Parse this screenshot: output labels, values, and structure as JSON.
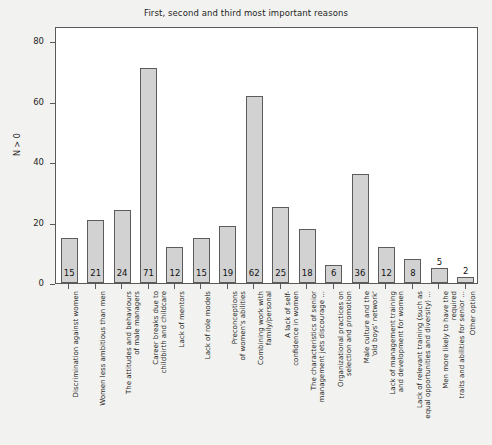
{
  "chart_data": {
    "type": "bar",
    "title": "First, second and third most important reasons",
    "xlabel": "",
    "ylabel": "N > 0",
    "ylim": [
      0,
      85
    ],
    "yticks": [
      0,
      20,
      40,
      60,
      80
    ],
    "grid": false,
    "legend": null,
    "categories": [
      "Discrimination against women",
      "Women less ambitious than men",
      "The attitudes and behaviours\nof male managers",
      "Career breaks due to\nchildbirth and childcare",
      "Lack of mentors",
      "Lack of role models",
      "Preconceptions\nof women's abilities",
      "Combining work with\nfamily/personal",
      "A lack of self-\nconfidence in women",
      "The characteristics of senior\nmanagement jets discourage ...",
      "Organizational practices on\nselection and promotion",
      "Male culture and the\n'old boys' network'",
      "Lack of management training\nand development for women",
      "Lack of relevant training (such as\nequal opportunities and diversity) ...",
      "Men more likely to have the required\ntraits and abilities for senior ...",
      "Other option"
    ],
    "values": [
      15,
      21,
      24,
      71,
      12,
      15,
      19,
      62,
      25,
      18,
      6,
      36,
      12,
      8,
      5,
      2
    ],
    "bar_color": "#d2d2d2",
    "bar_edge_color": "#5c5c5c"
  },
  "figure": {
    "background": "#f2f2f0",
    "plot_background": "#ffffff",
    "frame_color": "#5a5a5a"
  }
}
